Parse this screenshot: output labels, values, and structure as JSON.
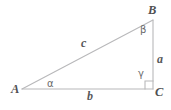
{
  "figure": {
    "kind": "right-triangle-diagram",
    "background_color": "#ffffff",
    "line_color": "#b8b8ba",
    "label_color": "#58585a",
    "angle_label_color": "#6a6a6c"
  },
  "vertices": {
    "A": {
      "label": "A",
      "x": 22,
      "y": 89
    },
    "B": {
      "label": "B",
      "x": 153,
      "y": 20
    },
    "C": {
      "label": "C",
      "x": 153,
      "y": 89
    }
  },
  "sides": {
    "hypotenuse": {
      "label": "c",
      "from": "A",
      "to": "B"
    },
    "opposite": {
      "label": "a",
      "from": "B",
      "to": "C"
    },
    "adjacent": {
      "label": "b",
      "from": "A",
      "to": "C"
    }
  },
  "angles": {
    "at_A": {
      "label": "α",
      "name": "alpha"
    },
    "at_B": {
      "label": "β",
      "name": "beta"
    },
    "at_C": {
      "label": "γ",
      "name": "gamma",
      "is_right_angle": true
    }
  }
}
